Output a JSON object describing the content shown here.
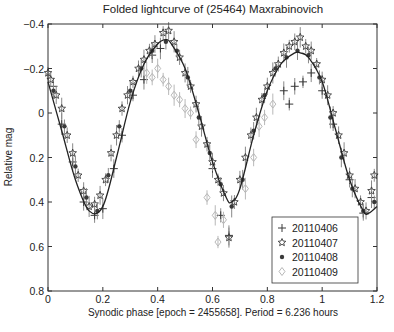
{
  "chart_data": {
    "type": "scatter",
    "title": "Folded lightcurve of (25464) Maxrabinovich",
    "xlabel": "Synodic phase [epoch = 2455658].  Period = 6.236 hours",
    "ylabel": "Relative mag",
    "xlim": [
      0,
      1.2
    ],
    "ylim": [
      -0.4,
      0.8
    ],
    "y_inverted": true,
    "xticks": [
      "0",
      "0.2",
      "0.4",
      "0.6",
      "0.8",
      "1",
      "1.2"
    ],
    "xtick_values": [
      0,
      0.2,
      0.4,
      0.6,
      0.8,
      1.0,
      1.2
    ],
    "yticks": [
      "-0.4",
      "-0.2",
      "0",
      "0.2",
      "0.4",
      "0.6",
      "0.8"
    ],
    "ytick_values": [
      -0.4,
      -0.2,
      0,
      0.2,
      0.4,
      0.6,
      0.8
    ],
    "grid": false,
    "legend_position": "lower right",
    "fit_curve": {
      "description": "Fourier fit (solid line)",
      "mean": 0.06,
      "period_phase": 1.0,
      "x": [
        0.0,
        0.05,
        0.1,
        0.15,
        0.2,
        0.25,
        0.3,
        0.35,
        0.4,
        0.43,
        0.45,
        0.5,
        0.55,
        0.6,
        0.65,
        0.67,
        0.7,
        0.75,
        0.8,
        0.85,
        0.9,
        0.92,
        0.95,
        1.0,
        1.05,
        1.1,
        1.15,
        1.17,
        1.2
      ],
      "y": [
        -0.14,
        0.08,
        0.3,
        0.44,
        0.42,
        0.2,
        -0.05,
        -0.22,
        -0.31,
        -0.33,
        -0.31,
        -0.2,
        0.0,
        0.22,
        0.38,
        0.4,
        0.34,
        0.1,
        -0.1,
        -0.22,
        -0.27,
        -0.27,
        -0.25,
        -0.14,
        0.08,
        0.3,
        0.44,
        0.45,
        0.42
      ]
    },
    "series": [
      {
        "name": "20110406",
        "marker": "plus",
        "points": [
          [
            0.02,
            -0.12
          ],
          [
            0.05,
            0.05
          ],
          [
            0.09,
            0.22
          ],
          [
            0.13,
            0.4
          ],
          [
            0.17,
            0.46
          ],
          [
            0.2,
            0.43
          ],
          [
            0.24,
            0.25
          ],
          [
            0.27,
            0.1
          ],
          [
            0.31,
            -0.08
          ],
          [
            0.35,
            -0.15
          ],
          [
            0.38,
            -0.26
          ],
          [
            0.41,
            -0.29
          ],
          [
            0.6,
            0.25
          ],
          [
            0.63,
            0.46
          ],
          [
            0.66,
            0.55
          ],
          [
            0.86,
            -0.1
          ],
          [
            0.88,
            -0.04
          ],
          [
            0.9,
            -0.12
          ],
          [
            0.93,
            -0.14
          ],
          [
            0.96,
            -0.18
          ],
          [
            1.0,
            -0.1
          ],
          [
            1.04,
            0.05
          ],
          [
            1.1,
            0.3
          ],
          [
            1.15,
            0.45
          ],
          [
            1.18,
            0.38
          ]
        ]
      },
      {
        "name": "20110407",
        "marker": "star",
        "points": [
          [
            0.0,
            -0.18
          ],
          [
            0.01,
            -0.15
          ],
          [
            0.03,
            -0.08
          ],
          [
            0.05,
            -0.02
          ],
          [
            0.07,
            0.1
          ],
          [
            0.09,
            0.18
          ],
          [
            0.11,
            0.28
          ],
          [
            0.13,
            0.35
          ],
          [
            0.15,
            0.42
          ],
          [
            0.17,
            0.41
          ],
          [
            0.19,
            0.37
          ],
          [
            0.21,
            0.3
          ],
          [
            0.23,
            0.18
          ],
          [
            0.25,
            0.1
          ],
          [
            0.27,
            -0.02
          ],
          [
            0.29,
            -0.08
          ],
          [
            0.31,
            -0.14
          ],
          [
            0.33,
            -0.2
          ],
          [
            0.35,
            -0.24
          ],
          [
            0.37,
            -0.28
          ],
          [
            0.39,
            -0.31
          ],
          [
            0.42,
            -0.36
          ],
          [
            0.44,
            -0.37
          ],
          [
            0.46,
            -0.32
          ],
          [
            0.48,
            -0.25
          ],
          [
            0.5,
            -0.18
          ],
          [
            0.52,
            -0.12
          ],
          [
            0.54,
            -0.04
          ],
          [
            0.56,
            0.06
          ],
          [
            0.58,
            0.14
          ],
          [
            0.6,
            0.22
          ],
          [
            0.62,
            0.3
          ],
          [
            0.64,
            0.36
          ],
          [
            0.66,
            0.56
          ],
          [
            0.68,
            0.4
          ],
          [
            0.7,
            0.3
          ],
          [
            0.72,
            0.2
          ],
          [
            0.74,
            0.1
          ],
          [
            0.76,
            0.02
          ],
          [
            0.78,
            -0.06
          ],
          [
            0.8,
            -0.12
          ],
          [
            0.82,
            -0.18
          ],
          [
            0.84,
            -0.22
          ],
          [
            0.86,
            -0.27
          ],
          [
            0.88,
            -0.3
          ],
          [
            0.9,
            -0.32
          ],
          [
            0.92,
            -0.34
          ],
          [
            0.94,
            -0.3
          ],
          [
            0.96,
            -0.28
          ],
          [
            0.98,
            -0.22
          ],
          [
            1.0,
            -0.15
          ],
          [
            1.02,
            -0.08
          ],
          [
            1.04,
            0.0
          ],
          [
            1.06,
            0.1
          ],
          [
            1.08,
            0.18
          ],
          [
            1.1,
            0.28
          ],
          [
            1.12,
            0.34
          ],
          [
            1.14,
            0.4
          ],
          [
            1.16,
            0.44
          ],
          [
            1.18,
            0.35
          ],
          [
            1.19,
            0.28
          ]
        ]
      },
      {
        "name": "20110408",
        "marker": "asterisk",
        "points": [
          [
            0.02,
            -0.1
          ],
          [
            0.06,
            0.06
          ],
          [
            0.1,
            0.24
          ],
          [
            0.14,
            0.38
          ],
          [
            0.18,
            0.44
          ],
          [
            0.22,
            0.28
          ],
          [
            0.26,
            0.06
          ],
          [
            0.3,
            -0.1
          ],
          [
            0.34,
            -0.2
          ],
          [
            0.38,
            -0.28
          ],
          [
            0.43,
            -0.32
          ],
          [
            0.47,
            -0.28
          ],
          [
            0.51,
            -0.16
          ],
          [
            0.55,
            0.02
          ],
          [
            0.59,
            0.18
          ],
          [
            0.63,
            0.32
          ],
          [
            0.67,
            0.42
          ],
          [
            0.71,
            0.3
          ],
          [
            0.75,
            0.08
          ],
          [
            0.79,
            -0.08
          ],
          [
            0.83,
            -0.2
          ],
          [
            0.87,
            -0.25
          ],
          [
            0.91,
            -0.28
          ],
          [
            0.95,
            -0.26
          ],
          [
            0.99,
            -0.16
          ],
          [
            1.03,
            0.02
          ],
          [
            1.07,
            0.2
          ],
          [
            1.11,
            0.34
          ],
          [
            1.15,
            0.44
          ],
          [
            1.19,
            0.4
          ]
        ]
      },
      {
        "name": "20110409",
        "marker": "diamond",
        "points": [
          [
            0.36,
            -0.18
          ],
          [
            0.38,
            -0.16
          ],
          [
            0.4,
            -0.2
          ],
          [
            0.42,
            -0.15
          ],
          [
            0.44,
            -0.12
          ],
          [
            0.46,
            -0.08
          ],
          [
            0.48,
            -0.06
          ],
          [
            0.5,
            -0.02
          ],
          [
            0.52,
            0.0
          ],
          [
            0.54,
            0.12
          ],
          [
            0.58,
            0.38
          ],
          [
            0.61,
            0.46
          ],
          [
            0.62,
            0.58
          ],
          [
            0.64,
            0.48
          ],
          [
            0.72,
            0.34
          ],
          [
            0.75,
            0.2
          ],
          [
            0.77,
            0.06
          ],
          [
            0.79,
            0.02
          ],
          [
            0.82,
            -0.04
          ]
        ]
      }
    ]
  },
  "legend": {
    "items": [
      {
        "label": "20110406",
        "marker": "plus",
        "color": "#333333"
      },
      {
        "label": "20110407",
        "marker": "star",
        "color": "#444444"
      },
      {
        "label": "20110408",
        "marker": "asterisk",
        "color": "#333333"
      },
      {
        "label": "20110409",
        "marker": "diamond",
        "color": "#bbbbbb"
      }
    ]
  },
  "colors": {
    "axis": "#333333",
    "curve": "#222222",
    "errorbar": "#888888",
    "series_dark": "#3a3a3a",
    "series_light": "#b8b8b8"
  }
}
